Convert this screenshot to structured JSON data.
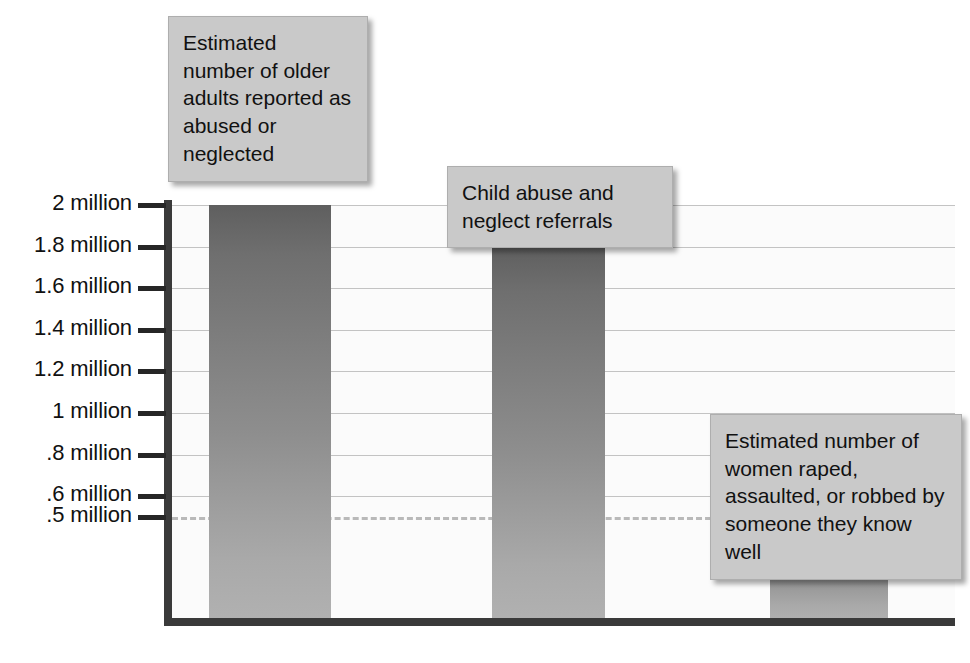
{
  "chart_data": {
    "type": "bar",
    "title": "",
    "subtitle": "",
    "xlabel": "",
    "ylabel": "",
    "grid": true,
    "legend_position": "annotations-as-callouts",
    "ylim": [
      0,
      2100000
    ],
    "y_tick_values": [
      2000000,
      1800000,
      1600000,
      1400000,
      1200000,
      1000000,
      800000,
      600000,
      500000
    ],
    "y_tick_labels": [
      "2 million",
      "1.8 million",
      "1.6 million",
      "1.4 million",
      "1.2 million",
      "1 million",
      ".8 million",
      ".6 million",
      ".5 million"
    ],
    "reference_line": {
      "value": 500000,
      "label": ".5 million",
      "style": "dashed"
    },
    "categories": [
      "Estimated number of older adults reported as abused or neglected",
      "Child abuse and neglect referrals",
      "Estimated number of women raped, assaulted, or robbed by someone they know well"
    ],
    "values": [
      2000000,
      1800000,
      500000
    ],
    "value_labels": [
      "2 million",
      "1.8 million",
      ".5 million"
    ],
    "bars": [
      {
        "label": "Estimated number of older adults reported as abused or neglected",
        "value": 2000000,
        "value_label": "2 million"
      },
      {
        "label": "Child abuse and neglect referrals",
        "value": 1800000,
        "value_label": "1.8 million"
      },
      {
        "label": "Estimated number of women raped, assaulted, or robbed by someone they know well",
        "value": 500000,
        "value_label": ".5 million"
      }
    ]
  },
  "callouts": [
    {
      "id": "callout-older-adults",
      "text": "Estimated number of older adults reported as abused or neglected"
    },
    {
      "id": "callout-child-abuse",
      "text": "Child abuse and neglect referrals"
    },
    {
      "id": "callout-women-assaulted",
      "text": "Estimated number of women raped, assaulted, or robbed by someone they know well"
    }
  ],
  "colors": {
    "bar_top": "#5f5f5f",
    "bar_bottom": "#b1b1b1",
    "axis": "#3a3a3a",
    "gridline": "#c3c3c3",
    "dashed_line": "#b9b9b9",
    "callout_background": "#c9c9c9",
    "callout_border": "#aeaeae",
    "plot_background": "#fbfbfb",
    "text": "#111111"
  }
}
